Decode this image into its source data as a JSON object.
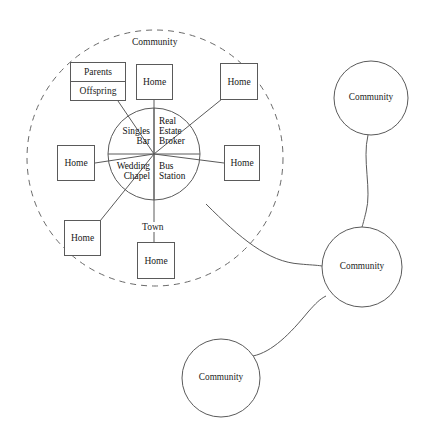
{
  "diagram": {
    "colors": {
      "stroke": "#5a5a5a",
      "dashed_stroke": "#6a6a6a",
      "text": "#111111",
      "background": "#ffffff"
    },
    "outer_community": {
      "label": "Community",
      "shape": "dashed-circle"
    },
    "town": {
      "label": "Town",
      "shape": "circle"
    },
    "hub_quadrants": [
      {
        "id": "singles-bar",
        "label": "Singles Bar",
        "lines": [
          "Singles",
          "Bar"
        ],
        "position": "upper-left"
      },
      {
        "id": "real-estate-broker",
        "label": "Real Estate Broker",
        "lines": [
          "Real",
          "Estate",
          "Broker"
        ],
        "position": "upper-right"
      },
      {
        "id": "wedding-chapel",
        "label": "Wedding Chapel",
        "lines": [
          "Wedding",
          "Chapel"
        ],
        "position": "lower-left"
      },
      {
        "id": "bus-station",
        "label": "Bus Station",
        "lines": [
          "Bus",
          "Station"
        ],
        "position": "lower-right"
      }
    ],
    "family_box": {
      "id": "parents-offspring",
      "rows": [
        "Parents",
        "Offspring"
      ]
    },
    "home_boxes": [
      {
        "id": "home-top",
        "label": "Home"
      },
      {
        "id": "home-top-right",
        "label": "Home"
      },
      {
        "id": "home-left",
        "label": "Home"
      },
      {
        "id": "home-right",
        "label": "Home"
      },
      {
        "id": "home-bottom-left",
        "label": "Home"
      },
      {
        "id": "home-bottom",
        "label": "Home"
      }
    ],
    "satellite_communities": [
      {
        "id": "community-top-right",
        "label": "Community"
      },
      {
        "id": "community-middle-right",
        "label": "Community"
      },
      {
        "id": "community-bottom",
        "label": "Community"
      }
    ]
  }
}
